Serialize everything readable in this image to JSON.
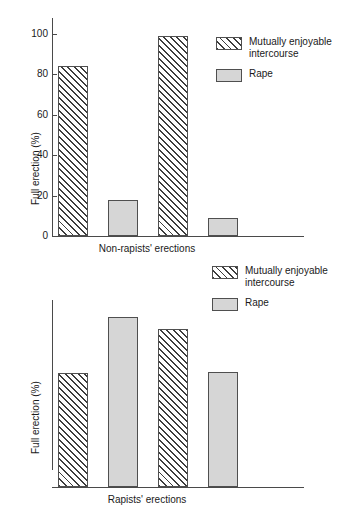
{
  "figure": {
    "background": "#ffffff",
    "line_color": "#4a4a4a",
    "hatch_color": "#3d3d3d",
    "solid_fill": "#d6d6d6"
  },
  "legend": {
    "hatch_label": "Mutually enjoyable\nintercourse",
    "solid_label": "Rape",
    "hatch_swatch_name": "hatched-pattern-swatch",
    "solid_swatch_name": "solid-gray-swatch"
  },
  "chart_data": [
    {
      "type": "bar",
      "id": "non-rapists",
      "title": "",
      "xlabel": "Non-rapists' erections",
      "ylabel": "Full erection (%)",
      "ylim": [
        0,
        100
      ],
      "yticks": [
        0,
        20,
        40,
        60,
        80,
        100
      ],
      "ytick_labels": [
        "0",
        "20",
        "40",
        "60",
        "80",
        "100"
      ],
      "grid": false,
      "legend_position": "top-right",
      "categories": [
        "Mutually enjoyable intercourse",
        "Rape",
        "Mutually enjoyable intercourse",
        "Rape"
      ],
      "series": [
        {
          "name": "Mutually enjoyable intercourse",
          "fill": "hatch",
          "values": [
            84,
            null,
            99,
            null
          ]
        },
        {
          "name": "Rape",
          "fill": "solid",
          "values": [
            null,
            18,
            null,
            9
          ]
        }
      ],
      "bars": [
        {
          "value": 84,
          "fill": "hatch",
          "series": "Mutually enjoyable intercourse"
        },
        {
          "value": 18,
          "fill": "solid",
          "series": "Rape"
        },
        {
          "value": 99,
          "fill": "hatch",
          "series": "Mutually enjoyable intercourse"
        },
        {
          "value": 9,
          "fill": "solid",
          "series": "Rape"
        }
      ]
    },
    {
      "type": "bar",
      "id": "rapists",
      "title": "",
      "xlabel": "Rapists' erections",
      "ylabel": "Full erection (%)",
      "ylim": [
        0,
        100
      ],
      "yticks": [
        0,
        20,
        40,
        60,
        80,
        100
      ],
      "ytick_labels": [
        "0",
        "20",
        "40",
        "60",
        "80",
        "100"
      ],
      "grid": false,
      "legend_position": "top-right",
      "categories": [
        "Mutually enjoyable intercourse",
        "Rape",
        "Mutually enjoyable intercourse",
        "Rape"
      ],
      "series": [
        {
          "name": "Mutually enjoyable intercourse",
          "fill": "hatch",
          "values": [
            66,
            null,
            92,
            null
          ]
        },
        {
          "name": "Rape",
          "fill": "solid",
          "values": [
            null,
            99,
            null,
            67
          ]
        }
      ],
      "bars": [
        {
          "value": 66,
          "fill": "hatch",
          "series": "Mutually enjoyable intercourse"
        },
        {
          "value": 99,
          "fill": "solid",
          "series": "Rape"
        },
        {
          "value": 92,
          "fill": "hatch",
          "series": "Mutually enjoyable intercourse"
        },
        {
          "value": 67,
          "fill": "solid",
          "series": "Rape"
        }
      ]
    }
  ]
}
